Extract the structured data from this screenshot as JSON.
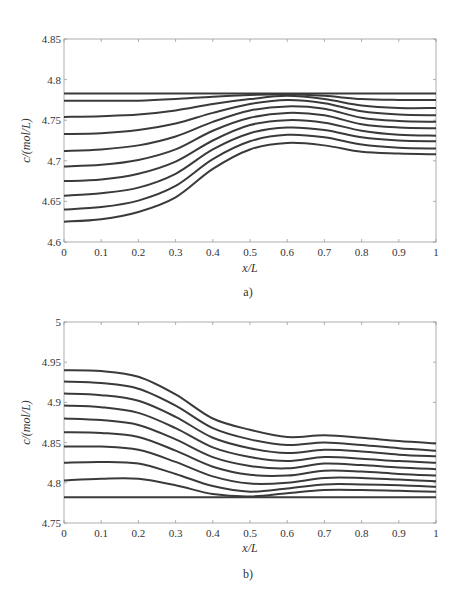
{
  "chart_data": [
    {
      "type": "line",
      "panel_label": "a)",
      "title": "",
      "xlabel": "x/L",
      "ylabel": "c/(mol/L)",
      "xlim": [
        0,
        1
      ],
      "ylim": [
        4.6,
        4.85
      ],
      "xticks": [
        0,
        0.1,
        0.2,
        0.3,
        0.4,
        0.5,
        0.6,
        0.7,
        0.8,
        0.9,
        1
      ],
      "xtick_labels": [
        "0",
        "0.1",
        "0.2",
        "0.3",
        "0.4",
        "0.5",
        "0.6",
        "0.7",
        "0.8",
        "0.9",
        "1"
      ],
      "yticks": [
        4.6,
        4.65,
        4.7,
        4.75,
        4.8,
        4.85
      ],
      "ytick_labels": [
        "4.6",
        "4.65",
        "4.7",
        "4.75",
        "4.8",
        "4.85"
      ],
      "grid": false,
      "legend": null,
      "x": [
        0,
        0.1,
        0.2,
        0.3,
        0.4,
        0.5,
        0.6,
        0.7,
        0.8,
        0.9,
        1.0
      ],
      "series": [
        {
          "name": "curve-1",
          "values": [
            4.783,
            4.783,
            4.783,
            4.783,
            4.783,
            4.783,
            4.783,
            4.783,
            4.783,
            4.783,
            4.783
          ]
        },
        {
          "name": "curve-2",
          "values": [
            4.774,
            4.774,
            4.774,
            4.776,
            4.779,
            4.781,
            4.782,
            4.78,
            4.776,
            4.775,
            4.775
          ]
        },
        {
          "name": "curve-3",
          "values": [
            4.754,
            4.755,
            4.757,
            4.762,
            4.77,
            4.776,
            4.78,
            4.776,
            4.768,
            4.765,
            4.765
          ]
        },
        {
          "name": "curve-4",
          "values": [
            4.733,
            4.734,
            4.738,
            4.746,
            4.759,
            4.77,
            4.775,
            4.771,
            4.761,
            4.757,
            4.756
          ]
        },
        {
          "name": "curve-5",
          "values": [
            4.712,
            4.714,
            4.719,
            4.73,
            4.748,
            4.762,
            4.767,
            4.764,
            4.753,
            4.749,
            4.748
          ]
        },
        {
          "name": "curve-6",
          "values": [
            4.693,
            4.695,
            4.701,
            4.714,
            4.737,
            4.753,
            4.759,
            4.756,
            4.745,
            4.741,
            4.74
          ]
        },
        {
          "name": "curve-7",
          "values": [
            4.675,
            4.677,
            4.684,
            4.699,
            4.725,
            4.744,
            4.75,
            4.747,
            4.737,
            4.732,
            4.731
          ]
        },
        {
          "name": "curve-8",
          "values": [
            4.657,
            4.66,
            4.667,
            4.684,
            4.714,
            4.734,
            4.741,
            4.738,
            4.729,
            4.725,
            4.724
          ]
        },
        {
          "name": "curve-9",
          "values": [
            4.64,
            4.643,
            4.651,
            4.669,
            4.702,
            4.724,
            4.732,
            4.729,
            4.72,
            4.716,
            4.715
          ]
        },
        {
          "name": "curve-10",
          "values": [
            4.625,
            4.628,
            4.637,
            4.655,
            4.69,
            4.714,
            4.722,
            4.719,
            4.711,
            4.709,
            4.708
          ]
        }
      ]
    },
    {
      "type": "line",
      "panel_label": "b)",
      "title": "",
      "xlabel": "x/L",
      "ylabel": "c/(mol/L)",
      "xlim": [
        0,
        1
      ],
      "ylim": [
        4.75,
        5
      ],
      "xticks": [
        0,
        0.1,
        0.2,
        0.3,
        0.4,
        0.5,
        0.6,
        0.7,
        0.8,
        0.9,
        1
      ],
      "xtick_labels": [
        "0",
        "0.1",
        "0.2",
        "0.3",
        "0.4",
        "0.5",
        "0.6",
        "0.7",
        "0.8",
        "0.9",
        "1"
      ],
      "yticks": [
        4.75,
        4.8,
        4.85,
        4.9,
        4.95,
        5
      ],
      "ytick_labels": [
        "4.75",
        "4.8",
        "4.85",
        "4.9",
        "4.95",
        "5"
      ],
      "grid": false,
      "legend": null,
      "x": [
        0,
        0.1,
        0.2,
        0.3,
        0.4,
        0.5,
        0.6,
        0.7,
        0.8,
        0.9,
        1.0
      ],
      "series": [
        {
          "name": "curve-1",
          "values": [
            4.94,
            4.939,
            4.932,
            4.91,
            4.88,
            4.866,
            4.857,
            4.859,
            4.856,
            4.852,
            4.849
          ]
        },
        {
          "name": "curve-2",
          "values": [
            4.926,
            4.924,
            4.917,
            4.896,
            4.868,
            4.854,
            4.847,
            4.85,
            4.847,
            4.843,
            4.84
          ]
        },
        {
          "name": "curve-3",
          "values": [
            4.911,
            4.909,
            4.902,
            4.882,
            4.856,
            4.843,
            4.837,
            4.841,
            4.839,
            4.835,
            4.833
          ]
        },
        {
          "name": "curve-4",
          "values": [
            4.896,
            4.894,
            4.887,
            4.868,
            4.844,
            4.832,
            4.827,
            4.832,
            4.83,
            4.827,
            4.825
          ]
        },
        {
          "name": "curve-5",
          "values": [
            4.88,
            4.878,
            4.872,
            4.854,
            4.832,
            4.821,
            4.818,
            4.824,
            4.822,
            4.819,
            4.817
          ]
        },
        {
          "name": "curve-6",
          "values": [
            4.863,
            4.862,
            4.857,
            4.84,
            4.82,
            4.81,
            4.809,
            4.815,
            4.814,
            4.811,
            4.809
          ]
        },
        {
          "name": "curve-7",
          "values": [
            4.845,
            4.845,
            4.841,
            4.826,
            4.808,
            4.799,
            4.8,
            4.806,
            4.806,
            4.804,
            4.802
          ]
        },
        {
          "name": "curve-8",
          "values": [
            4.825,
            4.826,
            4.824,
            4.811,
            4.796,
            4.789,
            4.793,
            4.798,
            4.798,
            4.797,
            4.795
          ]
        },
        {
          "name": "curve-9",
          "values": [
            4.803,
            4.805,
            4.805,
            4.797,
            4.786,
            4.783,
            4.787,
            4.791,
            4.791,
            4.79,
            4.789
          ]
        },
        {
          "name": "curve-10",
          "values": [
            4.782,
            4.782,
            4.782,
            4.782,
            4.782,
            4.782,
            4.782,
            4.782,
            4.782,
            4.782,
            4.782
          ]
        }
      ]
    }
  ],
  "style": {
    "line_color": "#3a3a3a",
    "axis_color": "#9a9a9a",
    "text_color": "#333333"
  }
}
